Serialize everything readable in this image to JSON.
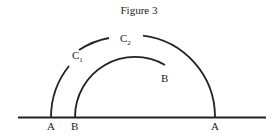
{
  "figure": {
    "title": "Figure 3",
    "labels": {
      "c1": "C",
      "c1_sub": "1",
      "c2": "C",
      "c2_sub": "2",
      "b_inner_end": "B",
      "a_left": "A",
      "b_base": "B",
      "a_right": "A"
    },
    "colors": {
      "stroke": "#222222",
      "background": "#ffffff"
    }
  }
}
